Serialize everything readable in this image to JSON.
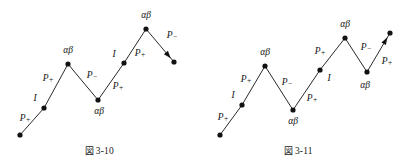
{
  "page": {
    "background": "#ffffff",
    "ink": "#121212"
  },
  "figures": [
    {
      "id": "fig-3-10",
      "caption_prefix": "図",
      "caption": "3-10",
      "vertices": [
        {
          "name": "start",
          "x": 20,
          "y": 135,
          "label": null,
          "label_x": null,
          "label_y": null
        },
        {
          "name": "node-i-1",
          "x": 44,
          "y": 108,
          "label": "I",
          "label_x": 35,
          "label_y": 99
        },
        {
          "name": "peak-1",
          "x": 68,
          "y": 64,
          "label": "αβ",
          "label_x": 68,
          "label_y": 51
        },
        {
          "name": "valley-1",
          "x": 98,
          "y": 100,
          "label": "αβ",
          "label_x": 99,
          "label_y": 112
        },
        {
          "name": "node-i-2",
          "x": 124,
          "y": 63,
          "label": "I",
          "label_x": 114,
          "label_y": 55
        },
        {
          "name": "peak-2",
          "x": 146,
          "y": 29,
          "label": "αβ",
          "label_x": 146,
          "label_y": 16
        },
        {
          "name": "end",
          "x": 174,
          "y": 62,
          "label": null,
          "label_x": null,
          "label_y": null
        }
      ],
      "segments": [
        {
          "name": "seg-1",
          "from": 0,
          "to": 1,
          "label": "P",
          "sub": "+",
          "label_x": 25,
          "label_y": 119
        },
        {
          "name": "seg-2",
          "from": 1,
          "to": 2,
          "label": "P",
          "sub": "+",
          "label_x": 48,
          "label_y": 79
        },
        {
          "name": "seg-3",
          "from": 2,
          "to": 3,
          "label": "P",
          "sub": "−",
          "label_x": 92,
          "label_y": 76
        },
        {
          "name": "seg-4",
          "from": 3,
          "to": 4,
          "label": "P",
          "sub": "+",
          "label_x": 118,
          "label_y": 87
        },
        {
          "name": "seg-5",
          "from": 4,
          "to": 5,
          "label": "P",
          "sub": "+",
          "label_x": 140,
          "label_y": 54
        },
        {
          "name": "seg-6",
          "from": 5,
          "to": 6,
          "label": "P",
          "sub": "−",
          "label_x": 172,
          "label_y": 36
        }
      ],
      "arrow_at": "end",
      "arrow_direction": "down-right"
    },
    {
      "id": "fig-3-11",
      "caption_prefix": "図",
      "caption": "3-11",
      "vertices": [
        {
          "name": "start",
          "x": 21,
          "y": 135,
          "label": null,
          "label_x": null,
          "label_y": null
        },
        {
          "name": "node-i-1",
          "x": 43,
          "y": 105,
          "label": "I",
          "label_x": 34,
          "label_y": 96
        },
        {
          "name": "peak-1",
          "x": 66,
          "y": 66,
          "label": "αβ",
          "label_x": 66,
          "label_y": 53
        },
        {
          "name": "valley-1",
          "x": 94,
          "y": 110,
          "label": "αβ",
          "label_x": 94,
          "label_y": 122
        },
        {
          "name": "node-i-2",
          "x": 121,
          "y": 70,
          "label": "I",
          "label_x": 130,
          "label_y": 79
        },
        {
          "name": "peak-2",
          "x": 146,
          "y": 38,
          "label": "αβ",
          "label_x": 146,
          "label_y": 25
        },
        {
          "name": "valley-2",
          "x": 168,
          "y": 72,
          "label": "αβ",
          "label_x": 166,
          "label_y": 86
        },
        {
          "name": "end",
          "x": 191,
          "y": 33,
          "label": null,
          "label_x": null,
          "label_y": null
        }
      ],
      "segments": [
        {
          "name": "seg-1",
          "from": 0,
          "to": 1,
          "label": "P",
          "sub": "+",
          "label_x": 24,
          "label_y": 118
        },
        {
          "name": "seg-2",
          "from": 1,
          "to": 2,
          "label": "P",
          "sub": "+",
          "label_x": 47,
          "label_y": 80
        },
        {
          "name": "seg-3",
          "from": 2,
          "to": 3,
          "label": "P",
          "sub": "−",
          "label_x": 88,
          "label_y": 83
        },
        {
          "name": "seg-4",
          "from": 3,
          "to": 4,
          "label": "P",
          "sub": "+",
          "label_x": 113,
          "label_y": 99
        },
        {
          "name": "seg-5",
          "from": 4,
          "to": 5,
          "label": "P",
          "sub": "+",
          "label_x": 121,
          "label_y": 52
        },
        {
          "name": "seg-6",
          "from": 5,
          "to": 6,
          "label": "P",
          "sub": "−",
          "label_x": 167,
          "label_y": 48
        },
        {
          "name": "seg-7",
          "from": 6,
          "to": 7,
          "label": "P",
          "sub": "+",
          "label_x": 188,
          "label_y": 62
        }
      ],
      "arrow_at": "end",
      "arrow_direction": "up-right"
    }
  ]
}
